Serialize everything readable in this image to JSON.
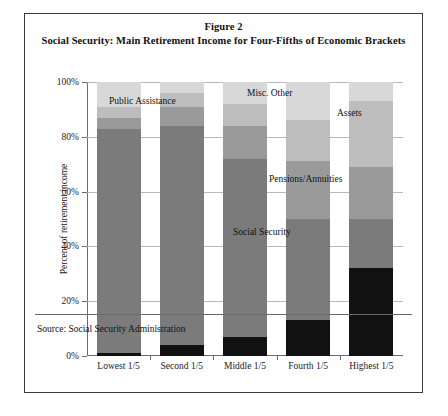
{
  "figure": {
    "title_line1": "Figure 2",
    "title_line2": "Social Security: Main Retirement Income for Four-Fifths of Economic Brackets",
    "source": "Source: Social Security Administration"
  },
  "chart_data": {
    "type": "bar",
    "stacked": true,
    "title": "Social Security: Main Retirement Income for Four-Fifths of Economic Brackets",
    "xlabel": "",
    "ylabel": "Percent of retirement income",
    "ylim": [
      0,
      100
    ],
    "ytick_labels": [
      "0%",
      "20%",
      "40%",
      "60%",
      "80%",
      "100%"
    ],
    "ytick_values": [
      0,
      20,
      40,
      60,
      80,
      100
    ],
    "grid": true,
    "legend_position": "inline-annotations",
    "categories": [
      "Lowest 1/5",
      "Second 1/5",
      "Middle 1/5",
      "Fourth 1/5",
      "Highest 1/5"
    ],
    "series": [
      {
        "name": "Wages",
        "color": "#111111",
        "values": [
          1,
          4,
          7,
          13,
          32
        ]
      },
      {
        "name": "Social Security",
        "color": "#7b7b7b",
        "values": [
          82,
          80,
          65,
          37,
          18
        ]
      },
      {
        "name": "Pensions/Annuities",
        "color": "#9a9a9a",
        "values": [
          4,
          7,
          12,
          21,
          19
        ]
      },
      {
        "name": "Assets",
        "color": "#bdbdbd",
        "values": [
          4,
          5,
          8,
          15,
          24
        ]
      },
      {
        "name": "Misc. Other",
        "color": "#d8d8d8",
        "values": [
          9,
          4,
          8,
          14,
          7
        ]
      }
    ],
    "annotations": [
      {
        "text": "Public Assistance",
        "x": 22,
        "y": 14
      },
      {
        "text": "Misc. Other",
        "x": 160,
        "y": 6
      },
      {
        "text": "Assets",
        "x": 250,
        "y": 26
      },
      {
        "text": "Pensions/Annuities",
        "x": 182,
        "y": 92
      },
      {
        "text": "Social Security",
        "x": 146,
        "y": 145
      },
      {
        "text": "Wages",
        "x": 268,
        "y": 238
      }
    ]
  }
}
